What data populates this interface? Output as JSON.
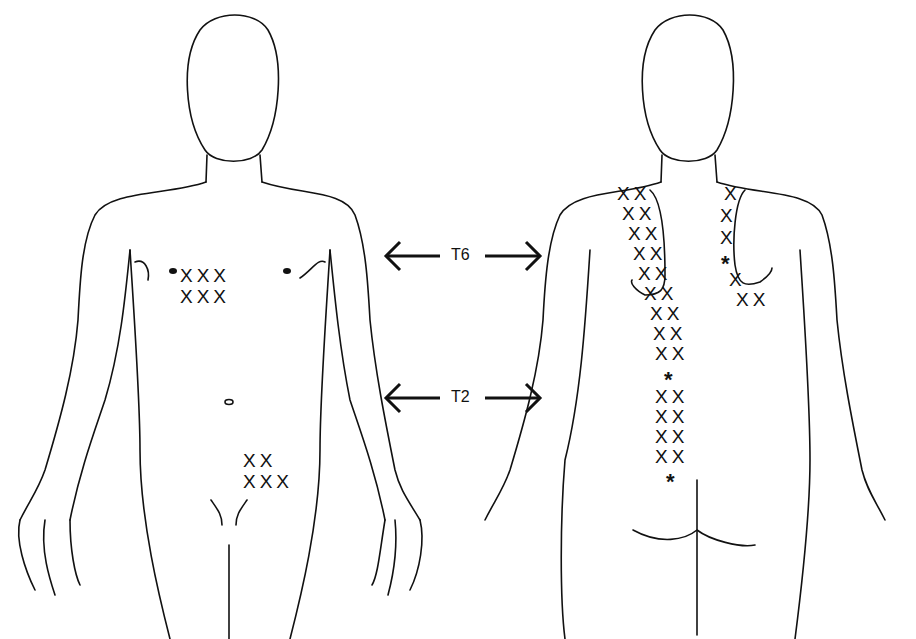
{
  "figure": {
    "type": "dermatome-pain-map",
    "views": [
      "anterior",
      "posterior"
    ],
    "levels": [
      {
        "label": "T6",
        "y": 256
      },
      {
        "label": "T2",
        "y": 398
      }
    ]
  },
  "front": {
    "chest_marks": [
      "XXX",
      "XXX"
    ],
    "groin_marks": [
      "XX",
      "XXX"
    ]
  },
  "back": {
    "left_column": [
      "XX",
      "XX",
      "XX",
      "XX",
      "XX",
      "XX",
      "XX",
      "XX",
      "XX",
      "XX",
      "*",
      "XX",
      "XX",
      "XX",
      "XX",
      "*"
    ],
    "right_column": [
      "X",
      "X",
      "X",
      "*",
      "X",
      "XX"
    ]
  }
}
